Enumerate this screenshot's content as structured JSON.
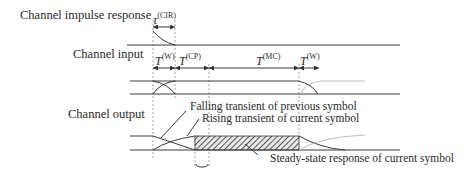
{
  "rows": {
    "impulse": {
      "label": "Channel impulse response"
    },
    "input": {
      "label": "Channel input"
    },
    "output": {
      "label": "Channel output"
    }
  },
  "intervals": {
    "cir": {
      "base": "τ",
      "sup": "(CIR)"
    },
    "window_start": {
      "base": "T",
      "sup": "(W)"
    },
    "cyclic_prefix": {
      "base": "T",
      "sup": "(CP)"
    },
    "multicarrier": {
      "base": "T",
      "sup": "(MC)"
    },
    "window_end": {
      "base": "T",
      "sup": "(W)"
    }
  },
  "annotations": {
    "falling": "Falling transient of previous symbol",
    "rising": "Rising transient of current symbol",
    "steady": "Steady-state response of current symbol"
  },
  "colors": {
    "line": "#3a3a3a",
    "faded": "#bdbdbd",
    "dashed": "#8a8a8a"
  }
}
